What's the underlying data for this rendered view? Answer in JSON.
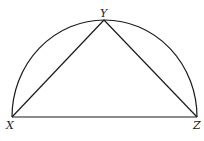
{
  "diagram": {
    "type": "semicircle with inscribed triangle",
    "stroke_color": "#1a1a1a",
    "background": "#ffffff",
    "points": {
      "X": {
        "label": "X",
        "x": 12,
        "y": 117
      },
      "Y": {
        "label": "Y",
        "x": 104,
        "y": 20
      },
      "Z": {
        "label": "Z",
        "x": 197,
        "y": 117
      }
    },
    "segments": [
      {
        "from": "X",
        "to": "Y"
      },
      {
        "from": "Y",
        "to": "Z"
      },
      {
        "from": "X",
        "to": "Z"
      }
    ],
    "arc": {
      "from": "X",
      "to": "Z",
      "through": "Y",
      "kind": "semicircle"
    }
  }
}
